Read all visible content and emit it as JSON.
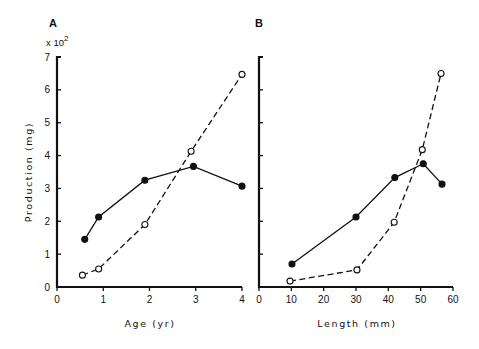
{
  "chart_data": [
    {
      "type": "line",
      "panel": "A",
      "title": "A",
      "xlabel": "Age (yr)",
      "ylabel": "Production (mg)",
      "y_multiplier": "x 10^2",
      "xlim": [
        0,
        4
      ],
      "ylim": [
        0,
        7
      ],
      "xticks": [
        0,
        1,
        2,
        3,
        4
      ],
      "yticks": [
        0,
        1,
        2,
        3,
        4,
        5,
        6,
        7
      ],
      "grid": false,
      "series": [
        {
          "name": "filled-solid",
          "marker": "filled-circle",
          "line": "solid",
          "x": [
            0.6,
            0.9,
            1.9,
            2.95,
            4.0
          ],
          "y": [
            1.45,
            2.13,
            3.25,
            3.67,
            3.07
          ]
        },
        {
          "name": "open-dashed",
          "marker": "open-circle",
          "line": "dashed",
          "x": [
            0.55,
            0.9,
            1.9,
            2.9,
            4.0
          ],
          "y": [
            0.36,
            0.55,
            1.9,
            4.13,
            6.47
          ]
        }
      ]
    },
    {
      "type": "line",
      "panel": "B",
      "title": "B",
      "xlabel": "Length (mm)",
      "ylabel": "",
      "xlim": [
        0,
        60
      ],
      "ylim": [
        0,
        7
      ],
      "xticks": [
        0,
        10,
        20,
        30,
        40,
        50,
        60
      ],
      "yticks": [
        0,
        1,
        2,
        3,
        4,
        5,
        6,
        7
      ],
      "grid": false,
      "series": [
        {
          "name": "filled-solid",
          "marker": "filled-circle",
          "line": "solid",
          "x": [
            10.2,
            30,
            42,
            50.8,
            56.6
          ],
          "y": [
            0.7,
            2.13,
            3.33,
            3.75,
            3.13
          ]
        },
        {
          "name": "open-dashed",
          "marker": "open-circle",
          "line": "dashed",
          "x": [
            9.6,
            30.3,
            41.8,
            50.5,
            56.3
          ],
          "y": [
            0.18,
            0.52,
            1.97,
            4.18,
            6.5
          ]
        }
      ]
    }
  ],
  "labels": {
    "panel_a": "A",
    "panel_b": "B",
    "multiplier_base": "x 10",
    "multiplier_exp": "2",
    "ylabel": "Production (mg)",
    "xlabel_a": "Age (yr)",
    "xlabel_b": "Length (mm)"
  },
  "colors": {
    "ink": "#111111",
    "background": "#ffffff"
  }
}
